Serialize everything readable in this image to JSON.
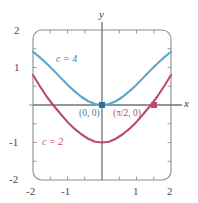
{
  "chart_data": {
    "type": "line",
    "title": "",
    "xlabel": "x",
    "ylabel": "y",
    "xlim": [
      -2,
      2
    ],
    "ylim": [
      -2,
      2
    ],
    "grid": false,
    "legend_position": "inline-annotations",
    "xticks": [
      "-2",
      "-1",
      "1",
      "2"
    ],
    "xtick_values": [
      -2,
      -1,
      1,
      2
    ],
    "yticks": [
      "2",
      "1",
      "-1",
      "-2"
    ],
    "ytick_values": [
      2,
      1,
      -1,
      -2
    ],
    "minor_tick_step": 0.5,
    "series": [
      {
        "name": "c = 4",
        "label": "c = 4",
        "color": "#5ba7ce",
        "formula": "y = 4 - 4*cos(x/2)^2 ... cosh-like minimum at origin",
        "x": [
          -2.0,
          -1.8,
          -1.6,
          -1.4,
          -1.2,
          -1.0,
          -0.8,
          -0.6,
          -0.4,
          -0.2,
          0.0,
          0.2,
          0.4,
          0.6,
          0.8,
          1.0,
          1.2,
          1.4,
          1.6,
          1.8,
          2.0
        ],
        "values": [
          1.42,
          1.27,
          1.1,
          0.92,
          0.73,
          0.54,
          0.37,
          0.22,
          0.1,
          0.025,
          0.0,
          0.025,
          0.1,
          0.22,
          0.37,
          0.54,
          0.73,
          0.92,
          1.1,
          1.27,
          1.42
        ]
      },
      {
        "name": "c = 2",
        "label": "c = 2",
        "color": "#bc4a6b",
        "formula": "same family shifted down by 1; zero at x = pi/2",
        "x": [
          -2.0,
          -1.8,
          -1.6,
          -1.4,
          -1.2,
          -1.0,
          -0.8,
          -0.6,
          -0.4,
          -0.2,
          0.0,
          0.2,
          0.4,
          0.6,
          0.8,
          1.0,
          1.2,
          1.4,
          1.6,
          1.8,
          2.0
        ],
        "values": [
          0.8,
          0.5,
          0.22,
          -0.02,
          -0.24,
          -0.45,
          -0.63,
          -0.78,
          -0.9,
          -0.98,
          -1.0,
          -0.98,
          -0.9,
          -0.78,
          -0.63,
          -0.45,
          -0.24,
          -0.02,
          0.22,
          0.5,
          0.8
        ]
      }
    ],
    "annotations": [
      {
        "name": "origin-point",
        "text": "(0, 0)",
        "x": 0,
        "y": 0,
        "color": "#3f7fa8",
        "marker": "square"
      },
      {
        "name": "pi-over-two-point",
        "text": "(π/2, 0)",
        "x": 1.5708,
        "y": 0,
        "color": "#bc4a6b",
        "marker": "square"
      }
    ],
    "colors": {
      "curve_blue": "#5ba7ce",
      "curve_red": "#bc4a6b",
      "label_blue": "#3f7fa8",
      "label_red": "#bc4a6b",
      "axis": "#6f7275",
      "frame": "#8a8d90",
      "tick_text": "#4a4a4a",
      "background": "#ffffff"
    }
  },
  "axes": {
    "y_name": "y",
    "x_name": "x"
  },
  "labels": {
    "curve_blue": "c = 4",
    "curve_red": "c = 2",
    "point_origin": "(0, 0)",
    "point_pi_half": "(π/2, 0)"
  },
  "ticks": {
    "y": [
      {
        "text": "2"
      },
      {
        "text": "1"
      },
      {
        "text": "-1"
      },
      {
        "text": "-2"
      }
    ],
    "x": [
      {
        "text": "-2"
      },
      {
        "text": "-1"
      },
      {
        "text": "1"
      },
      {
        "text": "2"
      }
    ]
  }
}
